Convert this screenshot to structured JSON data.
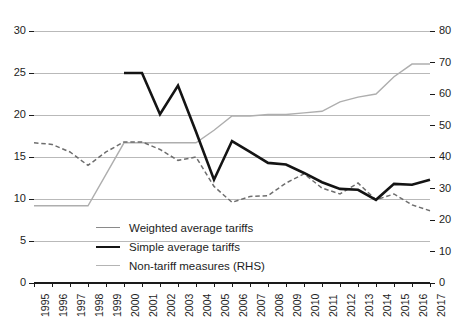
{
  "chart_data": {
    "type": "line",
    "title": "",
    "subtitle": "",
    "xlabel": "",
    "ylabel": "",
    "y2label": "",
    "grid": true,
    "legend_position": "center-bottom-inside",
    "x": [
      1995,
      1996,
      1997,
      1998,
      1999,
      2000,
      2001,
      2002,
      2003,
      2004,
      2005,
      2006,
      2007,
      2008,
      2009,
      2010,
      2011,
      2012,
      2013,
      2014,
      2015,
      2016,
      2017
    ],
    "categories": [
      "1995",
      "1996",
      "1997",
      "1998",
      "1999",
      "2000",
      "2001",
      "2002",
      "2003",
      "2004",
      "2005",
      "2006",
      "2007",
      "2008",
      "2009",
      "2010",
      "2011",
      "2012",
      "2013",
      "2014",
      "2015",
      "2016",
      "2017"
    ],
    "ylim": [
      0,
      30
    ],
    "yticks": [
      0,
      5,
      10,
      15,
      20,
      25,
      30
    ],
    "y2lim": [
      0,
      80
    ],
    "y2ticks": [
      0,
      10,
      20,
      30,
      40,
      50,
      60,
      70,
      80
    ],
    "series": [
      {
        "name": "Weighted average tariffs",
        "axis": "left",
        "style": "dashed",
        "color": "#6e6e6e",
        "values": [
          16.7,
          16.5,
          15.6,
          14.0,
          15.6,
          16.8,
          16.8,
          15.9,
          14.6,
          15.0,
          11.5,
          9.6,
          10.3,
          10.4,
          11.9,
          13.0,
          11.3,
          10.6,
          11.9,
          9.9,
          10.6,
          9.3,
          8.6
        ]
      },
      {
        "name": "Simple average tariffs",
        "axis": "left",
        "style": "solid-thick",
        "color": "#141414",
        "values": [
          null,
          null,
          null,
          null,
          null,
          25.0,
          25.0,
          20.1,
          23.5,
          18.0,
          12.3,
          16.9,
          15.6,
          14.3,
          14.1,
          13.1,
          12.0,
          11.2,
          11.1,
          9.9,
          11.8,
          11.7,
          12.3
        ]
      },
      {
        "name": "Non-tariff measures (RHS)",
        "axis": "right",
        "style": "solid-thin",
        "color": "#aeaeae",
        "values": [
          24.5,
          24.5,
          24.5,
          24.5,
          34.5,
          44.5,
          44.5,
          44.5,
          44.5,
          44.5,
          48.5,
          53.0,
          53.0,
          53.5,
          53.5,
          54.0,
          54.5,
          57.5,
          59.0,
          60.0,
          65.5,
          69.5,
          69.5
        ]
      }
    ]
  },
  "axes": {
    "left_ticks": [
      "0",
      "5",
      "10",
      "15",
      "20",
      "25",
      "30"
    ],
    "right_ticks": [
      "0",
      "10",
      "20",
      "30",
      "40",
      "50",
      "60",
      "70",
      "80"
    ],
    "x_ticks": [
      "1995",
      "1996",
      "1997",
      "1998",
      "1999",
      "2000",
      "2001",
      "2002",
      "2003",
      "2004",
      "2005",
      "2006",
      "2007",
      "2008",
      "2009",
      "2010",
      "2011",
      "2012",
      "2013",
      "2014",
      "2015",
      "2016",
      "2017"
    ]
  },
  "legend": {
    "items": [
      {
        "label": "Weighted average tariffs",
        "swatch": "weighted"
      },
      {
        "label": "Simple average tariffs",
        "swatch": "simple"
      },
      {
        "label": "Non-tariff measures (RHS)",
        "swatch": "ntm"
      }
    ]
  },
  "colors": {
    "background": "#ffffff",
    "gridline": "#b9b9b9",
    "axis": "#1a1a1a",
    "weighted": "#6e6e6e",
    "simple": "#141414",
    "ntm": "#aeaeae"
  }
}
